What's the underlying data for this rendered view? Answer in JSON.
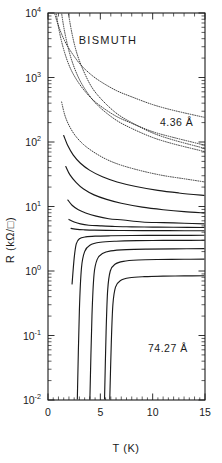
{
  "figure": {
    "title": "BISMUTH",
    "background": "#ffffff",
    "ink_color": "#1a1a1a"
  },
  "annotations": {
    "top_label": "4.36 Å",
    "bottom_label": "74.27 Å"
  },
  "axes": {
    "x": {
      "label": "T  (K)",
      "ticks": [
        "0",
        "5",
        "10",
        "15"
      ],
      "tick_values": [
        0,
        5,
        10,
        15
      ],
      "range": [
        0,
        15
      ],
      "minor_step": 1,
      "scale": "linear"
    },
    "y": {
      "label": "R (kΩ/□)",
      "label_mantissa": "10",
      "ticks": [
        "10⁴",
        "10³",
        "10²",
        "10¹",
        "10⁰",
        "10⁻¹",
        "10⁻²"
      ],
      "exponents": [
        "4",
        "3",
        "2",
        "1",
        "0",
        "-1",
        "-2"
      ],
      "range": [
        -2,
        4
      ],
      "scale": "log"
    }
  },
  "chart_data": {
    "type": "line",
    "title": "BISMUTH",
    "xlabel": "T  (K)",
    "ylabel": "R (kΩ/□)",
    "xlim": [
      0,
      15
    ],
    "ylim_log10": [
      -2,
      4
    ],
    "yscale": "log",
    "grid": false,
    "legend": "none",
    "annotations": [
      {
        "text": "4.36 Å",
        "x": 11.2,
        "y_log10": 2.55
      },
      {
        "text": "74.27 Å",
        "x": 11.0,
        "y_log10": -0.82
      },
      {
        "text": "BISMUTH",
        "x": 7.6,
        "y_log10": 3.62
      }
    ],
    "series_note": "Sheet resistance vs temperature for quench-condensed bismuth films of increasing thickness from 4.36 Å (top, insulating) to 74.27 Å (bottom, superconducting).",
    "series": [
      {
        "name": "4.36 Å",
        "thickness_A": 4.36,
        "points": [
          [
            0.12,
            4.62
          ],
          [
            0.3,
            4.3
          ],
          [
            0.6,
            4.02
          ],
          [
            1.0,
            3.8
          ],
          [
            1.5,
            3.6
          ],
          [
            2.0,
            3.45
          ],
          [
            3.0,
            3.22
          ],
          [
            4.0,
            3.06
          ],
          [
            5.0,
            2.94
          ],
          [
            6.5,
            2.8
          ],
          [
            8.0,
            2.7
          ],
          [
            10.0,
            2.58
          ],
          [
            12.0,
            2.49
          ],
          [
            15.0,
            2.38
          ]
        ]
      },
      {
        "name": "film-2",
        "thickness_A": 6.2,
        "points": [
          [
            0.4,
            4.55
          ],
          [
            0.7,
            4.1
          ],
          [
            1.1,
            3.7
          ],
          [
            1.6,
            3.38
          ],
          [
            2.2,
            3.12
          ],
          [
            3.0,
            2.9
          ],
          [
            4.0,
            2.7
          ],
          [
            5.0,
            2.56
          ],
          [
            6.5,
            2.4
          ],
          [
            8.0,
            2.29
          ],
          [
            10.0,
            2.16
          ],
          [
            12.0,
            2.07
          ],
          [
            15.0,
            1.95
          ]
        ]
      },
      {
        "name": "film-3",
        "thickness_A": 9.1,
        "points": [
          [
            0.9,
            4.58
          ],
          [
            1.2,
            4.12
          ],
          [
            1.6,
            3.7
          ],
          [
            2.2,
            3.3
          ],
          [
            3.0,
            2.97
          ],
          [
            4.0,
            2.71
          ],
          [
            5.0,
            2.53
          ],
          [
            6.5,
            2.34
          ],
          [
            8.0,
            2.21
          ],
          [
            10.0,
            2.07
          ],
          [
            12.0,
            1.97
          ],
          [
            15.0,
            1.85
          ]
        ]
      },
      {
        "name": "film-4",
        "thickness_A": 12.5,
        "points": [
          [
            1.5,
            4.58
          ],
          [
            1.9,
            4.05
          ],
          [
            2.4,
            3.6
          ],
          [
            3.0,
            3.26
          ],
          [
            4.0,
            2.9
          ],
          [
            5.0,
            2.68
          ],
          [
            6.5,
            2.45
          ],
          [
            8.0,
            2.3
          ],
          [
            10.0,
            2.14
          ],
          [
            12.0,
            2.03
          ],
          [
            15.0,
            1.9
          ]
        ]
      },
      {
        "name": "film-5",
        "thickness_A": 16.0,
        "points": [
          [
            1.3,
            2.62
          ],
          [
            1.6,
            2.42
          ],
          [
            2.0,
            2.26
          ],
          [
            2.6,
            2.1
          ],
          [
            3.4,
            1.96
          ],
          [
            4.4,
            1.84
          ],
          [
            5.6,
            1.73
          ],
          [
            7.0,
            1.64
          ],
          [
            9.0,
            1.55
          ],
          [
            11.0,
            1.48
          ],
          [
            13.0,
            1.43
          ],
          [
            15.0,
            1.38
          ]
        ]
      },
      {
        "name": "film-6",
        "thickness_A": 20.5,
        "points": [
          [
            1.5,
            2.1
          ],
          [
            1.9,
            1.94
          ],
          [
            2.4,
            1.8
          ],
          [
            3.1,
            1.67
          ],
          [
            4.0,
            1.56
          ],
          [
            5.2,
            1.46
          ],
          [
            6.6,
            1.38
          ],
          [
            8.4,
            1.31
          ],
          [
            10.5,
            1.25
          ],
          [
            12.5,
            1.21
          ],
          [
            15.0,
            1.17
          ]
        ]
      },
      {
        "name": "film-7",
        "thickness_A": 25.0,
        "points": [
          [
            1.7,
            1.62
          ],
          [
            2.1,
            1.49
          ],
          [
            2.7,
            1.37
          ],
          [
            3.4,
            1.27
          ],
          [
            4.4,
            1.18
          ],
          [
            5.6,
            1.11
          ],
          [
            7.0,
            1.05
          ],
          [
            9.0,
            0.99
          ],
          [
            11.0,
            0.95
          ],
          [
            13.0,
            0.92
          ],
          [
            15.0,
            0.9
          ]
        ]
      },
      {
        "name": "film-8",
        "thickness_A": 30.0,
        "points": [
          [
            1.9,
            1.1
          ],
          [
            2.3,
            1.02
          ],
          [
            2.9,
            0.95
          ],
          [
            3.6,
            0.9
          ],
          [
            4.6,
            0.85
          ],
          [
            5.8,
            0.81
          ],
          [
            7.2,
            0.79
          ],
          [
            9.0,
            0.76
          ],
          [
            11.0,
            0.75
          ],
          [
            13.0,
            0.74
          ],
          [
            15.0,
            0.73
          ]
        ]
      },
      {
        "name": "film-9",
        "thickness_A": 34.0,
        "points": [
          [
            2.0,
            0.8
          ],
          [
            2.5,
            0.76
          ],
          [
            3.1,
            0.73
          ],
          [
            3.9,
            0.71
          ],
          [
            5.0,
            0.7
          ],
          [
            6.4,
            0.69
          ],
          [
            8.0,
            0.685
          ],
          [
            10.0,
            0.68
          ],
          [
            12.0,
            0.678
          ],
          [
            15.0,
            0.675
          ]
        ]
      },
      {
        "name": "film-10",
        "thickness_A": 38.0,
        "points": [
          [
            2.2,
            0.66
          ],
          [
            2.8,
            0.645
          ],
          [
            3.5,
            0.638
          ],
          [
            4.4,
            0.633
          ],
          [
            5.6,
            0.63
          ],
          [
            7.2,
            0.628
          ],
          [
            9.0,
            0.626
          ],
          [
            11.5,
            0.625
          ],
          [
            15.0,
            0.624
          ]
        ]
      },
      {
        "name": "film-11",
        "thickness_A": 43.0,
        "points": [
          [
            2.3,
            -0.2
          ],
          [
            2.5,
            0.2
          ],
          [
            2.7,
            0.42
          ],
          [
            3.0,
            0.5
          ],
          [
            3.6,
            0.528
          ],
          [
            4.5,
            0.54
          ],
          [
            6.0,
            0.546
          ],
          [
            8.0,
            0.55
          ],
          [
            10.5,
            0.552
          ],
          [
            13.0,
            0.553
          ],
          [
            15.0,
            0.554
          ]
        ]
      },
      {
        "name": "film-12",
        "thickness_A": 49.0,
        "points": [
          [
            2.8,
            -2.0
          ],
          [
            3.0,
            -0.6
          ],
          [
            3.2,
            0.05
          ],
          [
            3.5,
            0.3
          ],
          [
            4.0,
            0.4
          ],
          [
            5.0,
            0.445
          ],
          [
            6.5,
            0.462
          ],
          [
            8.5,
            0.47
          ],
          [
            11.0,
            0.474
          ],
          [
            13.5,
            0.476
          ],
          [
            15.0,
            0.477
          ]
        ]
      },
      {
        "name": "film-13",
        "thickness_A": 56.0,
        "points": [
          [
            4.0,
            -2.0
          ],
          [
            4.2,
            -0.7
          ],
          [
            4.4,
            -0.05
          ],
          [
            4.7,
            0.18
          ],
          [
            5.2,
            0.27
          ],
          [
            6.0,
            0.312
          ],
          [
            7.5,
            0.332
          ],
          [
            9.5,
            0.34
          ],
          [
            12.0,
            0.344
          ],
          [
            15.0,
            0.346
          ]
        ]
      },
      {
        "name": "film-14",
        "thickness_A": 64.0,
        "points": [
          [
            5.4,
            -2.0
          ],
          [
            5.55,
            -0.95
          ],
          [
            5.7,
            -0.3
          ],
          [
            5.95,
            0.0
          ],
          [
            6.4,
            0.105
          ],
          [
            7.2,
            0.15
          ],
          [
            8.6,
            0.17
          ],
          [
            10.5,
            0.178
          ],
          [
            13.0,
            0.182
          ],
          [
            15.0,
            0.184
          ]
        ]
      },
      {
        "name": "74.27 Å",
        "thickness_A": 74.27,
        "points": [
          [
            5.9,
            -2.0
          ],
          [
            6.05,
            -1.1
          ],
          [
            6.2,
            -0.52
          ],
          [
            6.45,
            -0.25
          ],
          [
            6.9,
            -0.15
          ],
          [
            7.8,
            -0.105
          ],
          [
            9.2,
            -0.088
          ],
          [
            11.0,
            -0.08
          ],
          [
            13.0,
            -0.076
          ],
          [
            15.0,
            -0.074
          ]
        ]
      }
    ]
  },
  "geometry": {
    "plot_left": 48,
    "plot_right": 205,
    "plot_top": 13,
    "plot_bottom": 400,
    "px_per_decade": 61.33
  }
}
